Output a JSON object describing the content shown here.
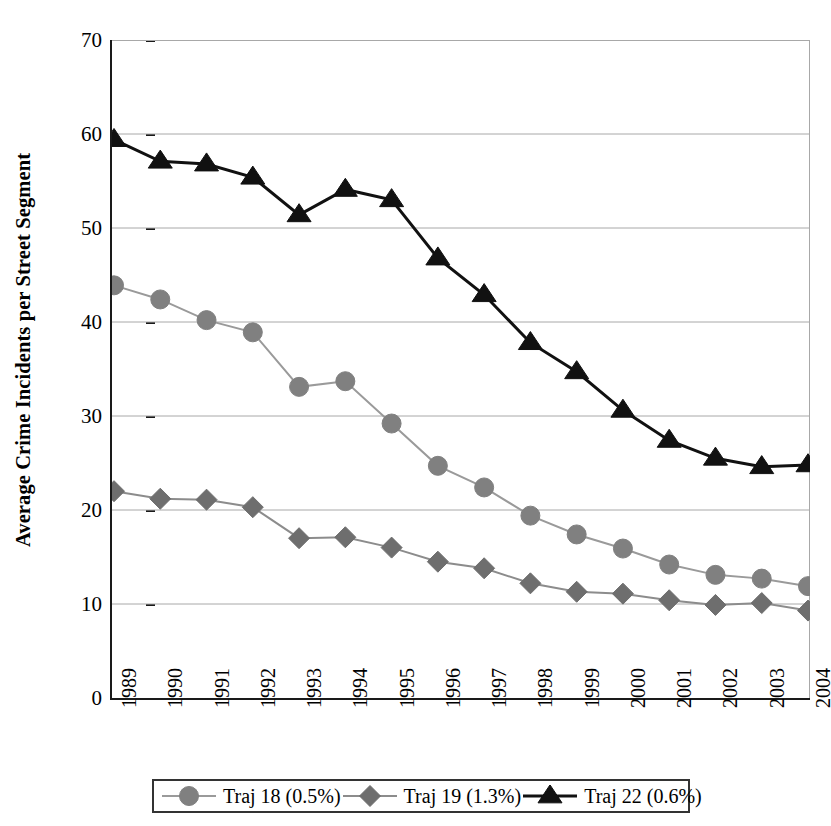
{
  "chart_data": {
    "type": "line",
    "title": "",
    "xlabel": "",
    "ylabel": "Average Crime Incidents per Street Segment",
    "x": [
      1989,
      1990,
      1991,
      1992,
      1993,
      1994,
      1995,
      1996,
      1997,
      1998,
      1999,
      2000,
      2001,
      2002,
      2003,
      2004
    ],
    "categories": [
      "1989",
      "1990",
      "1991",
      "1992",
      "1993",
      "1994",
      "1995",
      "1996",
      "1997",
      "1998",
      "1999",
      "2000",
      "2001",
      "2002",
      "2003",
      "2004"
    ],
    "ylim": [
      0,
      70
    ],
    "yticks": [
      0,
      10,
      20,
      30,
      40,
      50,
      60,
      70
    ],
    "ytick_labels": [
      "0",
      "10",
      "20",
      "30",
      "40",
      "50",
      "60",
      "70"
    ],
    "grid": "horizontal",
    "legend_position": "bottom",
    "series": [
      {
        "name": "Traj 18 (0.5%)",
        "marker": "circle",
        "color": "#808080",
        "line_color": "#9a9a9a",
        "values": [
          43.9,
          42.4,
          40.2,
          38.9,
          33.1,
          33.7,
          29.2,
          24.7,
          22.4,
          19.4,
          17.4,
          15.9,
          14.2,
          13.1,
          12.7,
          11.9
        ]
      },
      {
        "name": "Traj 19 (1.3%)",
        "marker": "diamond",
        "color": "#6e6e6e",
        "line_color": "#8c8c8c",
        "values": [
          22.0,
          21.2,
          21.1,
          20.3,
          17.0,
          17.1,
          16.0,
          14.5,
          13.8,
          12.2,
          11.3,
          11.1,
          10.4,
          9.9,
          10.1,
          9.3
        ]
      },
      {
        "name": "Traj 22 (0.6%)",
        "marker": "triangle",
        "color": "#111111",
        "line_color": "#111111",
        "values": [
          59.4,
          57.1,
          56.8,
          55.4,
          51.4,
          54.1,
          53.0,
          46.8,
          42.9,
          37.8,
          34.7,
          30.6,
          27.4,
          25.5,
          24.6,
          24.8
        ]
      }
    ]
  },
  "legend": {
    "items": [
      {
        "label": "Traj 18 (0.5%)",
        "marker": "circle-marker-icon"
      },
      {
        "label": "Traj 19 (1.3%)",
        "marker": "diamond-marker-icon"
      },
      {
        "label": "Traj 22 (0.6%)",
        "marker": "triangle-marker-icon"
      }
    ]
  },
  "colors": {
    "axis": "#1a1a1a",
    "grid": "#a8a8a8",
    "series_gray": "#808080",
    "series_dark": "#111111",
    "legend_border": "#333333"
  }
}
